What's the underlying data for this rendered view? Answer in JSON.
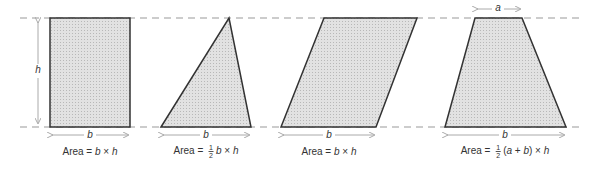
{
  "colors": {
    "outline": "#333333",
    "fill": "#d6d6d6",
    "guide": "#999999",
    "text": "#333333"
  },
  "variables": {
    "height": "h",
    "base": "b",
    "top": "a"
  },
  "shapes": [
    {
      "name": "rectangle",
      "area_prefix": "Area = ",
      "formula_b": "b",
      "times": " × ",
      "formula_h": "h"
    },
    {
      "name": "triangle",
      "area_prefix": "Area = ",
      "frac_num": "1",
      "frac_den": "2",
      "formula_b": "b",
      "times": " × ",
      "formula_h": "h"
    },
    {
      "name": "parallelogram",
      "area_prefix": "Area = ",
      "formula_b": "b",
      "times": " × ",
      "formula_h": "h"
    },
    {
      "name": "trapezoid",
      "area_prefix": "Area = ",
      "frac_num": "1",
      "frac_den": "2",
      "open": "(",
      "formula_a": "a",
      "plus": " + ",
      "formula_b": "b",
      "close": ")",
      "times": " × ",
      "formula_h": "h"
    }
  ]
}
